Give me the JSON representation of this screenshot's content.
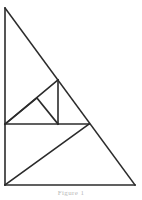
{
  "figure": {
    "background_color": "#ffffff",
    "stroke_color": "#2b2b2b",
    "stroke_width": 1.6,
    "canvas": {
      "width": 142,
      "height": 200
    },
    "vertices": {
      "apex_top": {
        "label": "A",
        "x": 5,
        "y": 8
      },
      "left_mid": {
        "label": "B",
        "x": 5,
        "y": 124
      },
      "bottom_left": {
        "label": "C",
        "x": 5,
        "y": 185
      },
      "bottom_right": {
        "label": "D",
        "x": 135,
        "y": 185
      },
      "right_mid": {
        "label": "E",
        "x": 89,
        "y": 124
      },
      "medium_apex": {
        "label": "F",
        "x": 58,
        "y": 80
      },
      "medium_foot": {
        "label": "G",
        "x": 58,
        "y": 124
      },
      "small_apex": {
        "label": "H",
        "x": 37,
        "y": 98
      }
    },
    "segments": [
      {
        "name": "outer-left-edge",
        "x1": 5,
        "y1": 8,
        "x2": 5,
        "y2": 185
      },
      {
        "name": "outer-bottom-edge",
        "x1": 5,
        "y1": 185,
        "x2": 135,
        "y2": 185
      },
      {
        "name": "outer-hypotenuse",
        "x1": 5,
        "y1": 8,
        "x2": 135,
        "y2": 185
      },
      {
        "name": "mid-horizontal",
        "x1": 5,
        "y1": 124,
        "x2": 89,
        "y2": 124
      },
      {
        "name": "medium-hypotenuse-left",
        "x1": 5,
        "y1": 124,
        "x2": 58,
        "y2": 80
      },
      {
        "name": "medium-vertical",
        "x1": 58,
        "y1": 80,
        "x2": 58,
        "y2": 124
      },
      {
        "name": "small-hypotenuse-left",
        "x1": 5,
        "y1": 124,
        "x2": 37,
        "y2": 98
      },
      {
        "name": "small-hypotenuse-right",
        "x1": 37,
        "y1": 98,
        "x2": 58,
        "y2": 124
      },
      {
        "name": "lower-diagonal",
        "x1": 5,
        "y1": 185,
        "x2": 89,
        "y2": 124
      }
    ],
    "caption": "Figure 1"
  }
}
